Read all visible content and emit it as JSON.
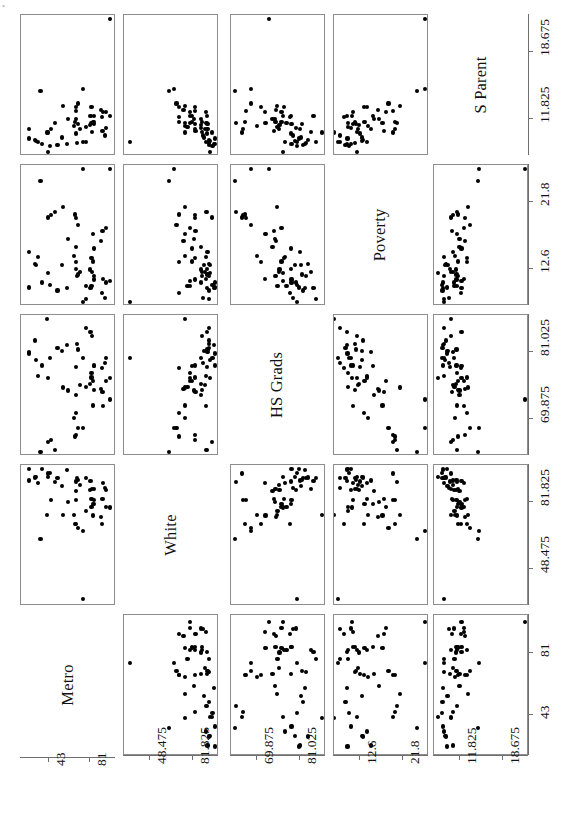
{
  "figure": {
    "type": "scatterplot-matrix",
    "variables": [
      "Metro",
      "White",
      "HS Grads",
      "Poverty",
      "S Parent"
    ],
    "n_variables": 5,
    "n_points_per_panel": 51,
    "grid": "5x5 lower/upper triangle with anti-diagonal variable labels",
    "point_color": "#000000",
    "panel_border_color": "#8d8d8d",
    "background": "#ffffff"
  },
  "diagonal_labels": [
    {
      "id": "metro",
      "text": "Metro",
      "row": 5,
      "col": 1
    },
    {
      "id": "white",
      "text": "White",
      "row": 4,
      "col": 2
    },
    {
      "id": "hsgrads",
      "text": "HS Grads",
      "row": 3,
      "col": 3
    },
    {
      "id": "poverty",
      "text": "Poverty",
      "row": 2,
      "col": 4
    },
    {
      "id": "sparent",
      "text": "S Parent",
      "row": 1,
      "col": 5
    }
  ],
  "axes": {
    "bottom": [
      {
        "variable": "Metro",
        "ticks": [
          "81",
          "43"
        ]
      },
      {
        "variable": "White",
        "ticks": [
          "81.825",
          "48.475"
        ]
      },
      {
        "variable": "HS Grads",
        "ticks": [
          "81.025",
          "69.875"
        ]
      },
      {
        "variable": "Poverty",
        "ticks": [
          "21.8",
          "12.6"
        ]
      },
      {
        "variable": "S Parent",
        "ticks": [
          "18.675",
          "11.825"
        ]
      }
    ],
    "right": [
      {
        "variable": "S Parent",
        "ticks": [
          "18.675",
          "11.825"
        ]
      },
      {
        "variable": "Poverty",
        "ticks": [
          "21.8",
          "12.6"
        ]
      },
      {
        "variable": "HS Grads",
        "ticks": [
          "81.025",
          "69.875"
        ]
      },
      {
        "variable": "White",
        "ticks": [
          "81.825",
          "48.475"
        ]
      },
      {
        "variable": "Metro",
        "ticks": [
          "81",
          "43"
        ]
      }
    ]
  },
  "chart_data": {
    "type": "scatter",
    "title": "",
    "xlabel": "",
    "ylabel": "",
    "matrix": true,
    "variables": [
      "Metro",
      "White",
      "HS Grads",
      "Poverty",
      "S Parent"
    ],
    "axis_ranges": {
      "Metro": [
        20,
        102
      ],
      "White": [
        31.8,
        98.5
      ],
      "HS Grads": [
        64.3,
        86.6
      ],
      "Poverty": [
        8.0,
        26.4
      ],
      "S Parent": [
        8.4,
        22.1
      ]
    },
    "tick_values": {
      "Metro": [
        81,
        43
      ],
      "White": [
        81.825,
        48.475
      ],
      "HS Grads": [
        81.025,
        69.875
      ],
      "Poverty": [
        21.8,
        12.6
      ],
      "S Parent": [
        18.675,
        11.825
      ]
    },
    "series_name": "US States",
    "points": [
      {
        "Metro": 67.4,
        "White": 71.0,
        "HS Grads": 66.9,
        "Poverty": 20.1,
        "S Parent": 11.5
      },
      {
        "Metro": 41.1,
        "White": 75.5,
        "HS Grads": 86.6,
        "Poverty": 7.1,
        "S Parent": 10.4
      },
      {
        "Metro": 84.7,
        "White": 80.8,
        "HS Grads": 78.7,
        "Poverty": 15.4,
        "S Parent": 12.1
      },
      {
        "Metro": 44.7,
        "White": 82.9,
        "HS Grads": 66.3,
        "Poverty": 20.0,
        "S Parent": 10.8
      },
      {
        "Metro": 96.7,
        "White": 79.3,
        "HS Grads": 76.2,
        "Poverty": 18.2,
        "S Parent": 12.5
      },
      {
        "Metro": 81.8,
        "White": 92.5,
        "HS Grads": 84.4,
        "Poverty": 9.9,
        "S Parent": 12.1
      },
      {
        "Metro": 95.7,
        "White": 89.0,
        "HS Grads": 79.2,
        "Poverty": 8.5,
        "S Parent": 10.1
      },
      {
        "Metro": 82.7,
        "White": 79.4,
        "HS Grads": 77.5,
        "Poverty": 10.2,
        "S Parent": 11.4
      },
      {
        "Metro": 100.0,
        "White": 27.4,
        "HS Grads": 73.1,
        "Poverty": 26.4,
        "S Parent": 22.1
      },
      {
        "Metro": 93.0,
        "White": 83.5,
        "HS Grads": 74.4,
        "Poverty": 17.8,
        "S Parent": 10.6
      },
      {
        "Metro": 67.7,
        "White": 71.0,
        "HS Grads": 70.9,
        "Poverty": 13.5,
        "S Parent": 13.0
      },
      {
        "Metro": 74.7,
        "White": 33.4,
        "HS Grads": 80.1,
        "Poverty": 8.0,
        "S Parent": 9.4
      },
      {
        "Metro": 30.0,
        "White": 94.4,
        "HS Grads": 79.7,
        "Poverty": 13.1,
        "S Parent": 9.5
      },
      {
        "Metro": 84.0,
        "White": 81.0,
        "HS Grads": 76.2,
        "Poverty": 13.6,
        "S Parent": 11.5
      },
      {
        "Metro": 71.6,
        "White": 90.6,
        "HS Grads": 75.6,
        "Poverty": 12.2,
        "S Parent": 10.8
      },
      {
        "Metro": 43.8,
        "White": 96.6,
        "HS Grads": 80.1,
        "Poverty": 10.3,
        "S Parent": 9.0
      },
      {
        "Metro": 54.6,
        "White": 90.1,
        "HS Grads": 81.3,
        "Poverty": 13.1,
        "S Parent": 9.9
      },
      {
        "Metro": 48.5,
        "White": 92.0,
        "HS Grads": 64.6,
        "Poverty": 20.4,
        "S Parent": 11.4
      },
      {
        "Metro": 75.0,
        "White": 67.3,
        "HS Grads": 68.3,
        "Poverty": 26.4,
        "S Parent": 14.9
      },
      {
        "Metro": 35.7,
        "White": 98.4,
        "HS Grads": 78.8,
        "Poverty": 10.7,
        "S Parent": 9.2
      },
      {
        "Metro": 92.8,
        "White": 71.0,
        "HS Grads": 78.4,
        "Poverty": 9.3,
        "S Parent": 12.0
      },
      {
        "Metro": 96.2,
        "White": 87.8,
        "HS Grads": 80.0,
        "Poverty": 10.7,
        "S Parent": 10.9
      },
      {
        "Metro": 82.7,
        "White": 83.4,
        "HS Grads": 76.8,
        "Poverty": 14.1,
        "S Parent": 13.0
      },
      {
        "Metro": 69.3,
        "White": 94.0,
        "HS Grads": 82.4,
        "Poverty": 11.6,
        "S Parent": 9.3
      },
      {
        "Metro": 34.6,
        "White": 63.5,
        "HS Grads": 64.3,
        "Poverty": 24.7,
        "S Parent": 14.7
      },
      {
        "Metro": 68.3,
        "White": 87.6,
        "HS Grads": 73.9,
        "Poverty": 15.6,
        "S Parent": 11.8
      },
      {
        "Metro": 24.0,
        "White": 92.7,
        "HS Grads": 81.0,
        "Poverty": 14.9,
        "S Parent": 10.8
      },
      {
        "Metro": 50.6,
        "White": 93.8,
        "HS Grads": 81.8,
        "Poverty": 9.6,
        "S Parent": 9.1
      },
      {
        "Metro": 84.8,
        "White": 83.1,
        "HS Grads": 78.8,
        "Poverty": 11.1,
        "S Parent": 11.3
      },
      {
        "Metro": 59.4,
        "White": 98.0,
        "HS Grads": 82.2,
        "Poverty": 9.9,
        "S Parent": 9.2
      },
      {
        "Metro": 100.0,
        "White": 79.2,
        "HS Grads": 76.7,
        "Poverty": 10.9,
        "S Parent": 12.1
      },
      {
        "Metro": 56.0,
        "White": 75.6,
        "HS Grads": 75.1,
        "Poverty": 21.1,
        "S Parent": 13.1
      },
      {
        "Metro": 91.7,
        "White": 74.4,
        "HS Grads": 74.8,
        "Poverty": 16.4,
        "S Parent": 12.7
      },
      {
        "Metro": 66.3,
        "White": 75.6,
        "HS Grads": 70.0,
        "Poverty": 14.4,
        "S Parent": 11.1
      },
      {
        "Metro": 41.6,
        "White": 94.6,
        "HS Grads": 76.7,
        "Poverty": 12.0,
        "S Parent": 8.4
      },
      {
        "Metro": 81.3,
        "White": 87.8,
        "HS Grads": 75.7,
        "Poverty": 12.5,
        "S Parent": 11.2
      },
      {
        "Metro": 60.6,
        "White": 82.1,
        "HS Grads": 74.6,
        "Poverty": 16.7,
        "S Parent": 11.8
      },
      {
        "Metro": 70.0,
        "White": 92.8,
        "HS Grads": 81.5,
        "Poverty": 11.8,
        "S Parent": 11.3
      },
      {
        "Metro": 84.8,
        "White": 88.5,
        "HS Grads": 74.7,
        "Poverty": 11.6,
        "S Parent": 11.5
      },
      {
        "Metro": 93.8,
        "White": 91.4,
        "HS Grads": 72.0,
        "Poverty": 11.2,
        "S Parent": 12.5
      },
      {
        "Metro": 69.8,
        "White": 69.0,
        "HS Grads": 68.3,
        "Poverty": 18.7,
        "S Parent": 13.4
      },
      {
        "Metro": 32.6,
        "White": 91.6,
        "HS Grads": 77.1,
        "Poverty": 14.2,
        "S Parent": 9.4
      },
      {
        "Metro": 67.7,
        "White": 83.0,
        "HS Grads": 67.1,
        "Poverty": 19.6,
        "S Parent": 12.6
      },
      {
        "Metro": 83.9,
        "White": 75.2,
        "HS Grads": 72.1,
        "Poverty": 17.4,
        "S Parent": 11.4
      },
      {
        "Metro": 77.5,
        "White": 93.8,
        "HS Grads": 85.1,
        "Poverty": 8.4,
        "S Parent": 9.4
      },
      {
        "Metro": 23.4,
        "White": 98.6,
        "HS Grads": 80.8,
        "Poverty": 10.0,
        "S Parent": 9.8
      },
      {
        "Metro": 77.5,
        "White": 77.4,
        "HS Grads": 75.2,
        "Poverty": 10.2,
        "S Parent": 11.0
      },
      {
        "Metro": 83.0,
        "White": 88.5,
        "HS Grads": 83.8,
        "Poverty": 12.1,
        "S Parent": 10.5
      },
      {
        "Metro": 41.8,
        "White": 96.2,
        "HS Grads": 66.0,
        "Poverty": 19.7,
        "S Parent": 10.4
      },
      {
        "Metro": 68.1,
        "White": 92.2,
        "HS Grads": 78.6,
        "Poverty": 12.6,
        "S Parent": 10.3
      },
      {
        "Metro": 29.6,
        "White": 94.2,
        "HS Grads": 83.0,
        "Poverty": 13.3,
        "S Parent": 9.6
      }
    ]
  }
}
